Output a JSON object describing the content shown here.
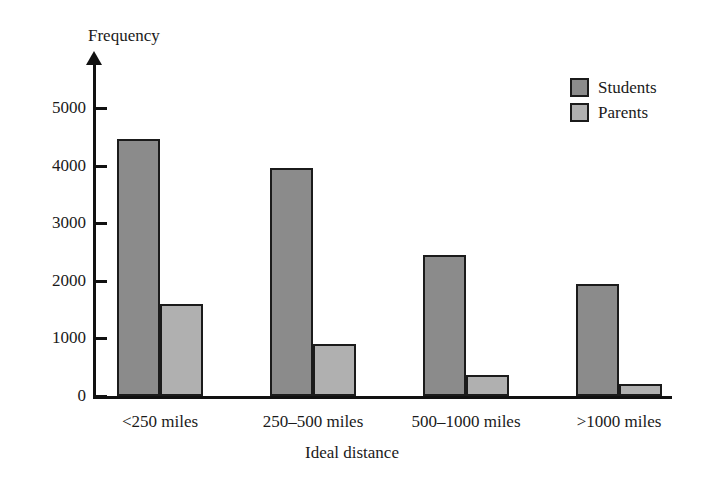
{
  "chart_data": {
    "type": "bar",
    "title": "",
    "xlabel": "Ideal distance",
    "ylabel": "Frequency",
    "categories": [
      "<250 miles",
      "250–500 miles",
      "500–1000 miles",
      ">1000 miles"
    ],
    "series": [
      {
        "name": "Students",
        "values": [
          4470,
          3950,
          2450,
          1950
        ],
        "color": "#8b8b8b"
      },
      {
        "name": "Parents",
        "values": [
          1590,
          900,
          370,
          210
        ],
        "color": "#b0b0b0"
      }
    ],
    "ylim": [
      0,
      5500
    ],
    "yticks": [
      0,
      1000,
      2000,
      3000,
      4000,
      5000
    ],
    "ytick_labels": [
      "0",
      "1000",
      "2000",
      "3000",
      "4000",
      "5000"
    ],
    "grid": false,
    "legend_position": "top-right",
    "axis_color": "#111111",
    "bar_border_color": "#1b1b1b"
  },
  "legend": {
    "items": [
      {
        "label": "Students",
        "color": "#8b8b8b"
      },
      {
        "label": "Parents",
        "color": "#b0b0b0"
      }
    ]
  }
}
